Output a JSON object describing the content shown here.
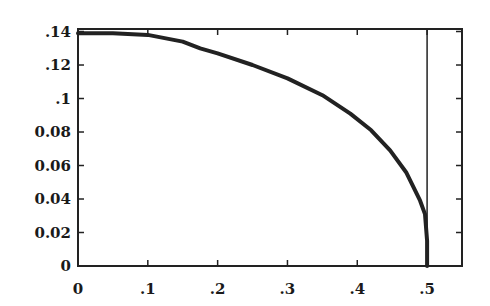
{
  "chart_data": {
    "type": "line",
    "title": "",
    "xlabel": "",
    "ylabel": "",
    "xlim": [
      0,
      0.55
    ],
    "ylim": [
      0,
      0.1415
    ],
    "grid": false,
    "legend": null,
    "x_ticks": [
      {
        "value": 0,
        "label": "0"
      },
      {
        "value": 0.1,
        "label": ".1"
      },
      {
        "value": 0.2,
        "label": ".2"
      },
      {
        "value": 0.3,
        "label": ".3"
      },
      {
        "value": 0.4,
        "label": ".4"
      },
      {
        "value": 0.5,
        "label": ".5"
      }
    ],
    "y_ticks": [
      {
        "value": 0,
        "label": "0"
      },
      {
        "value": 0.02,
        "label": "0.02"
      },
      {
        "value": 0.04,
        "label": "0.04"
      },
      {
        "value": 0.06,
        "label": "0.06"
      },
      {
        "value": 0.08,
        "label": "0.08"
      },
      {
        "value": 0.1,
        "label": ".1"
      },
      {
        "value": 0.12,
        "label": ".12"
      },
      {
        "value": 0.14,
        "label": ".14"
      }
    ],
    "series": [
      {
        "name": "curve",
        "color": "#222222",
        "x": [
          0,
          0.05,
          0.1,
          0.15,
          0.175,
          0.2,
          0.25,
          0.3,
          0.35,
          0.39,
          0.42,
          0.447,
          0.47,
          0.49,
          0.497,
          0.5,
          0.5
        ],
        "y": [
          0.139,
          0.139,
          0.138,
          0.134,
          0.13,
          0.127,
          0.12,
          0.112,
          0.102,
          0.091,
          0.081,
          0.069,
          0.056,
          0.039,
          0.031,
          0.015,
          0.0
        ]
      }
    ],
    "annotations": [
      {
        "type": "vline",
        "x": 0.5,
        "color": "#222222"
      }
    ]
  }
}
